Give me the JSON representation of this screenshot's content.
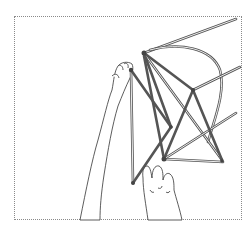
{
  "illustration": {
    "subject": "hands assembling a frame of rods connected by joints",
    "style": "black-and-white line drawing",
    "caption": "",
    "colors": {
      "line": "#333333",
      "rod": "#555555",
      "frame_border": "#8a8a8a",
      "background": "#ffffff"
    }
  }
}
